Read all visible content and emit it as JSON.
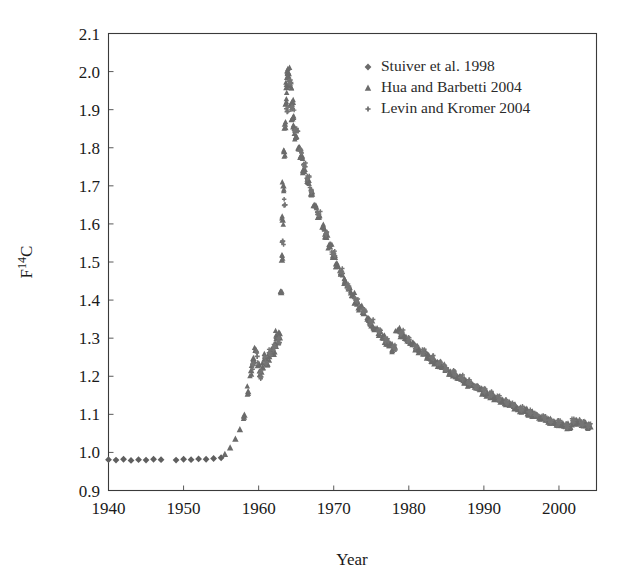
{
  "chart_data": {
    "type": "scatter",
    "title": "",
    "xlabel": "Year",
    "ylabel": "F14C",
    "ylabel_display": "F¹⁴C",
    "xlim": [
      1940,
      2005
    ],
    "ylim": [
      0.9,
      2.1
    ],
    "xticks": [
      1940,
      1950,
      1960,
      1970,
      1980,
      1990,
      2000
    ],
    "xtick_labels": [
      "1940",
      "1950",
      "1960",
      "1970",
      "1980",
      "1990",
      "2000"
    ],
    "yticks": [
      0.9,
      1.0,
      1.1,
      1.2,
      1.3,
      1.4,
      1.5,
      1.6,
      1.7,
      1.8,
      1.9,
      2.0,
      2.1
    ],
    "ytick_labels": [
      "0.9",
      "1.0",
      "1.1",
      "1.2",
      "1.3",
      "1.4",
      "1.5",
      "1.6",
      "1.7",
      "1.8",
      "1.9",
      "2.0",
      "2.1"
    ],
    "grid": false,
    "legend_position": "top-right",
    "marker_color": "#6b6b6b",
    "series": [
      {
        "name": "Stuiver et al. 1998",
        "marker": "diamond",
        "color": "#5f5f5f",
        "points": [
          [
            1940.0,
            0.981
          ],
          [
            1941.0,
            0.98
          ],
          [
            1942.0,
            0.982
          ],
          [
            1943.0,
            0.979
          ],
          [
            1944.0,
            0.981
          ],
          [
            1945.0,
            0.98
          ],
          [
            1946.0,
            0.982
          ],
          [
            1947.0,
            0.981
          ],
          [
            1949.0,
            0.98
          ],
          [
            1950.0,
            0.982
          ],
          [
            1951.0,
            0.981
          ],
          [
            1952.0,
            0.983
          ],
          [
            1953.0,
            0.982
          ],
          [
            1954.0,
            0.984
          ],
          [
            1955.0,
            0.986
          ]
        ]
      },
      {
        "name": "Hua and Barbetti 2004",
        "marker": "triangle",
        "color": "#6b6b6b",
        "points": [
          [
            1955.5,
            0.995
          ],
          [
            1956.2,
            1.012
          ],
          [
            1956.9,
            1.035
          ],
          [
            1957.5,
            1.06
          ],
          [
            1958.1,
            1.098
          ],
          [
            1958.6,
            1.16
          ],
          [
            1959.0,
            1.215
          ],
          [
            1959.3,
            1.247
          ],
          [
            1959.6,
            1.268
          ],
          [
            1959.9,
            1.228
          ],
          [
            1960.2,
            1.205
          ],
          [
            1960.5,
            1.222
          ],
          [
            1960.8,
            1.246
          ],
          [
            1961.1,
            1.23
          ],
          [
            1961.4,
            1.252
          ],
          [
            1961.7,
            1.27
          ],
          [
            1962.0,
            1.258
          ],
          [
            1962.2,
            1.285
          ],
          [
            1962.4,
            1.305
          ],
          [
            1962.6,
            1.29
          ],
          [
            1962.8,
            1.312
          ],
          [
            1963.0,
            1.42
          ],
          [
            1963.1,
            1.505
          ],
          [
            1963.2,
            1.61
          ],
          [
            1963.3,
            1.7
          ],
          [
            1963.4,
            1.79
          ],
          [
            1963.5,
            1.862
          ],
          [
            1963.6,
            1.915
          ],
          [
            1963.7,
            1.958
          ],
          [
            1963.8,
            1.985
          ],
          [
            1963.9,
            1.998
          ],
          [
            1964.0,
            1.995
          ],
          [
            1964.2,
            1.962
          ],
          [
            1964.4,
            1.918
          ],
          [
            1964.6,
            1.88
          ],
          [
            1964.8,
            1.852
          ],
          [
            1965.0,
            1.83
          ],
          [
            1965.3,
            1.8
          ],
          [
            1965.6,
            1.775
          ],
          [
            1966.0,
            1.742
          ],
          [
            1966.5,
            1.712
          ],
          [
            1967.0,
            1.68
          ],
          [
            1967.5,
            1.648
          ],
          [
            1968.0,
            1.618
          ],
          [
            1968.5,
            1.592
          ],
          [
            1969.0,
            1.565
          ],
          [
            1969.5,
            1.54
          ],
          [
            1970.0,
            1.515
          ],
          [
            1970.5,
            1.492
          ],
          [
            1971.0,
            1.47
          ],
          [
            1971.5,
            1.45
          ],
          [
            1972.0,
            1.43
          ],
          [
            1972.5,
            1.412
          ],
          [
            1973.0,
            1.395
          ],
          [
            1973.5,
            1.38
          ],
          [
            1974.0,
            1.365
          ],
          [
            1974.5,
            1.35
          ],
          [
            1975.0,
            1.337
          ],
          [
            1975.5,
            1.325
          ],
          [
            1976.0,
            1.313
          ],
          [
            1976.5,
            1.302
          ],
          [
            1977.0,
            1.291
          ],
          [
            1977.5,
            1.281
          ],
          [
            1978.0,
            1.272
          ],
          [
            1978.5,
            1.32
          ],
          [
            1979.0,
            1.31
          ],
          [
            1979.5,
            1.3
          ],
          [
            1980.0,
            1.292
          ],
          [
            1980.5,
            1.283
          ],
          [
            1981.0,
            1.275
          ],
          [
            1981.5,
            1.267
          ],
          [
            1982.0,
            1.259
          ],
          [
            1982.5,
            1.252
          ],
          [
            1983.0,
            1.245
          ],
          [
            1983.5,
            1.238
          ],
          [
            1984.0,
            1.231
          ],
          [
            1984.5,
            1.224
          ],
          [
            1985.0,
            1.218
          ],
          [
            1985.5,
            1.212
          ],
          [
            1986.0,
            1.205
          ],
          [
            1986.5,
            1.199
          ],
          [
            1987.0,
            1.193
          ],
          [
            1987.5,
            1.187
          ],
          [
            1988.0,
            1.181
          ],
          [
            1988.5,
            1.176
          ],
          [
            1989.0,
            1.17
          ],
          [
            1989.5,
            1.165
          ],
          [
            1990.0,
            1.16
          ],
          [
            1990.5,
            1.154
          ],
          [
            1991.0,
            1.149
          ],
          [
            1991.5,
            1.144
          ],
          [
            1992.0,
            1.139
          ],
          [
            1992.5,
            1.134
          ],
          [
            1993.0,
            1.13
          ],
          [
            1993.5,
            1.125
          ],
          [
            1994.0,
            1.121
          ],
          [
            1994.5,
            1.116
          ],
          [
            1995.0,
            1.112
          ],
          [
            1995.5,
            1.108
          ],
          [
            1996.0,
            1.104
          ],
          [
            1996.5,
            1.1
          ],
          [
            1997.0,
            1.096
          ],
          [
            1997.5,
            1.092
          ],
          [
            1998.0,
            1.089
          ],
          [
            1998.5,
            1.085
          ],
          [
            1999.0,
            1.082
          ],
          [
            1999.5,
            1.078
          ],
          [
            2000.0,
            1.075
          ],
          [
            2000.5,
            1.072
          ],
          [
            2001.0,
            1.069
          ],
          [
            2001.5,
            1.066
          ],
          [
            2002.0,
            1.082
          ],
          [
            2002.5,
            1.079
          ],
          [
            2003.0,
            1.076
          ],
          [
            2003.5,
            1.073
          ],
          [
            2004.0,
            1.07
          ]
        ]
      },
      {
        "name": "Levin and Kromer 2004",
        "marker": "plus",
        "color": "#757575",
        "points": [
          [
            1959.2,
            1.232
          ],
          [
            1959.8,
            1.252
          ],
          [
            1960.3,
            1.198
          ],
          [
            1960.9,
            1.238
          ],
          [
            1961.5,
            1.262
          ],
          [
            1962.1,
            1.276
          ],
          [
            1962.7,
            1.3
          ],
          [
            1963.2,
            1.555
          ],
          [
            1963.5,
            1.65
          ],
          [
            1963.8,
            1.895
          ],
          [
            1964.1,
            1.975
          ],
          [
            1964.5,
            1.902
          ],
          [
            1965.0,
            1.845
          ],
          [
            1965.5,
            1.792
          ],
          [
            1966.0,
            1.755
          ],
          [
            1966.5,
            1.72
          ],
          [
            1967.0,
            1.688
          ],
          [
            1968.0,
            1.625
          ],
          [
            1969.0,
            1.572
          ],
          [
            1970.0,
            1.522
          ],
          [
            1971.0,
            1.476
          ],
          [
            1972.0,
            1.436
          ],
          [
            1973.0,
            1.4
          ],
          [
            1974.0,
            1.37
          ],
          [
            1975.0,
            1.342
          ],
          [
            1976.0,
            1.318
          ],
          [
            1977.0,
            1.296
          ],
          [
            1978.0,
            1.277
          ],
          [
            1979.0,
            1.315
          ],
          [
            1980.0,
            1.296
          ],
          [
            1981.0,
            1.279
          ],
          [
            1982.0,
            1.263
          ],
          [
            1983.0,
            1.249
          ],
          [
            1984.0,
            1.235
          ],
          [
            1985.0,
            1.222
          ],
          [
            1986.0,
            1.209
          ],
          [
            1987.0,
            1.197
          ],
          [
            1988.0,
            1.185
          ],
          [
            1989.0,
            1.174
          ],
          [
            1990.0,
            1.163
          ],
          [
            1991.0,
            1.152
          ],
          [
            1992.0,
            1.143
          ],
          [
            1993.0,
            1.133
          ],
          [
            1994.0,
            1.124
          ],
          [
            1995.0,
            1.115
          ],
          [
            1996.0,
            1.107
          ],
          [
            1997.0,
            1.099
          ],
          [
            1998.0,
            1.091
          ],
          [
            1999.0,
            1.084
          ],
          [
            2000.0,
            1.077
          ],
          [
            2001.0,
            1.071
          ],
          [
            2002.0,
            1.084
          ],
          [
            2003.0,
            1.078
          ],
          [
            2004.0,
            1.072
          ]
        ]
      }
    ]
  },
  "legend": {
    "entries": [
      {
        "label": "Stuiver et al. 1998",
        "marker": "diamond"
      },
      {
        "label": "Hua and Barbetti 2004",
        "marker": "triangle"
      },
      {
        "label": "Levin and Kromer 2004",
        "marker": "plus"
      }
    ]
  },
  "axis": {
    "x_title": "Year",
    "y_title": "F14C"
  }
}
